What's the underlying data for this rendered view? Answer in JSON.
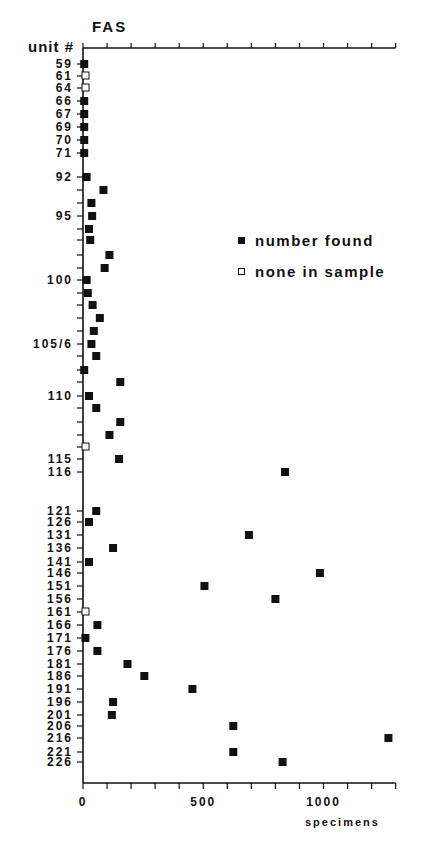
{
  "chart_data": {
    "type": "scatter",
    "title": "FAS",
    "ylabel": "unit #",
    "xlabel": "specimens",
    "xlim": [
      0,
      1300
    ],
    "x_ticks_labeled": [
      0,
      500,
      1000
    ],
    "x_tick_step": 100,
    "grid": false,
    "legend_position": "right-middle",
    "legend": [
      {
        "symbol": "filled-square",
        "label": "number found"
      },
      {
        "symbol": "open-square",
        "label": "none in sample"
      }
    ],
    "points": [
      {
        "unit": "59",
        "label": "59",
        "y": 64,
        "value": 5,
        "found": true
      },
      {
        "unit": "61",
        "label": "61",
        "y": 76,
        "value": 0,
        "found": false
      },
      {
        "unit": "64",
        "label": "64",
        "y": 88,
        "value": 0,
        "found": false
      },
      {
        "unit": "66",
        "label": "66",
        "y": 101,
        "value": 5,
        "found": true
      },
      {
        "unit": "67",
        "label": "67",
        "y": 114,
        "value": 5,
        "found": true
      },
      {
        "unit": "69",
        "label": "69",
        "y": 127,
        "value": 5,
        "found": true
      },
      {
        "unit": "70",
        "label": "70",
        "y": 140,
        "value": 5,
        "found": true
      },
      {
        "unit": "71",
        "label": "71",
        "y": 153,
        "value": 5,
        "found": true
      },
      {
        "unit": "92",
        "label": "92",
        "y": 177,
        "value": 15,
        "found": true
      },
      {
        "unit": "93",
        "label": "",
        "y": 190,
        "value": 85,
        "found": true
      },
      {
        "unit": "94",
        "label": "",
        "y": 203,
        "value": 35,
        "found": true
      },
      {
        "unit": "95",
        "label": "95",
        "y": 216,
        "value": 38,
        "found": true
      },
      {
        "unit": "96",
        "label": "",
        "y": 229,
        "value": 25,
        "found": true
      },
      {
        "unit": "97",
        "label": "",
        "y": 240,
        "value": 30,
        "found": true
      },
      {
        "unit": "98",
        "label": "",
        "y": 255,
        "value": 110,
        "found": true
      },
      {
        "unit": "99",
        "label": "",
        "y": 268,
        "value": 90,
        "found": true
      },
      {
        "unit": "100",
        "label": "100",
        "y": 280,
        "value": 15,
        "found": true
      },
      {
        "unit": "101",
        "label": "",
        "y": 293,
        "value": 20,
        "found": true
      },
      {
        "unit": "102",
        "label": "",
        "y": 305,
        "value": 40,
        "found": true
      },
      {
        "unit": "103",
        "label": "",
        "y": 318,
        "value": 70,
        "found": true
      },
      {
        "unit": "104",
        "label": "",
        "y": 331,
        "value": 45,
        "found": true
      },
      {
        "unit": "105/6",
        "label": "105/6",
        "y": 344,
        "value": 35,
        "found": true
      },
      {
        "unit": "107",
        "label": "",
        "y": 356,
        "value": 55,
        "found": true
      },
      {
        "unit": "108",
        "label": "",
        "y": 370,
        "value": 5,
        "found": true
      },
      {
        "unit": "109",
        "label": "",
        "y": 382,
        "value": 155,
        "found": true
      },
      {
        "unit": "110",
        "label": "110",
        "y": 396,
        "value": 25,
        "found": true
      },
      {
        "unit": "111",
        "label": "",
        "y": 408,
        "value": 55,
        "found": true
      },
      {
        "unit": "112",
        "label": "",
        "y": 422,
        "value": 155,
        "found": true
      },
      {
        "unit": "113",
        "label": "",
        "y": 435,
        "value": 110,
        "found": true
      },
      {
        "unit": "114",
        "label": "",
        "y": 447,
        "value": 0,
        "found": false
      },
      {
        "unit": "115",
        "label": "115",
        "y": 459,
        "value": 150,
        "found": true
      },
      {
        "unit": "116",
        "label": "116",
        "y": 472,
        "value": 840,
        "found": true
      },
      {
        "unit": "121",
        "label": "121",
        "y": 511,
        "value": 55,
        "found": true
      },
      {
        "unit": "126",
        "label": "126",
        "y": 522,
        "value": 25,
        "found": true
      },
      {
        "unit": "131",
        "label": "131",
        "y": 535,
        "value": 690,
        "found": true
      },
      {
        "unit": "136",
        "label": "136",
        "y": 548,
        "value": 125,
        "found": true
      },
      {
        "unit": "141",
        "label": "141",
        "y": 562,
        "value": 25,
        "found": true
      },
      {
        "unit": "146",
        "label": "146",
        "y": 573,
        "value": 985,
        "found": true
      },
      {
        "unit": "151",
        "label": "151",
        "y": 586,
        "value": 505,
        "found": true
      },
      {
        "unit": "156",
        "label": "156",
        "y": 599,
        "value": 800,
        "found": true
      },
      {
        "unit": "161",
        "label": "161",
        "y": 612,
        "value": 0,
        "found": false
      },
      {
        "unit": "166",
        "label": "166",
        "y": 625,
        "value": 60,
        "found": true
      },
      {
        "unit": "171",
        "label": "171",
        "y": 638,
        "value": 10,
        "found": true
      },
      {
        "unit": "176",
        "label": "176",
        "y": 651,
        "value": 60,
        "found": true
      },
      {
        "unit": "181",
        "label": "181",
        "y": 664,
        "value": 185,
        "found": true
      },
      {
        "unit": "186",
        "label": "186",
        "y": 676,
        "value": 255,
        "found": true
      },
      {
        "unit": "191",
        "label": "191",
        "y": 689,
        "value": 455,
        "found": true
      },
      {
        "unit": "196",
        "label": "196",
        "y": 702,
        "value": 125,
        "found": true
      },
      {
        "unit": "201",
        "label": "201",
        "y": 715,
        "value": 120,
        "found": true
      },
      {
        "unit": "206",
        "label": "206",
        "y": 726,
        "value": 625,
        "found": true
      },
      {
        "unit": "216",
        "label": "216",
        "y": 738,
        "value": 1270,
        "found": true
      },
      {
        "unit": "221",
        "label": "221",
        "y": 752,
        "value": 625,
        "found": true
      },
      {
        "unit": "226",
        "label": "226",
        "y": 762,
        "value": 830,
        "found": true
      }
    ]
  },
  "labels": {
    "title": "FAS",
    "ylabel": "unit #",
    "xlabel": "specimens",
    "legend_found": "number found",
    "legend_none": "none in sample"
  },
  "colors": {
    "ink": "#111111",
    "background": "#ffffff"
  }
}
